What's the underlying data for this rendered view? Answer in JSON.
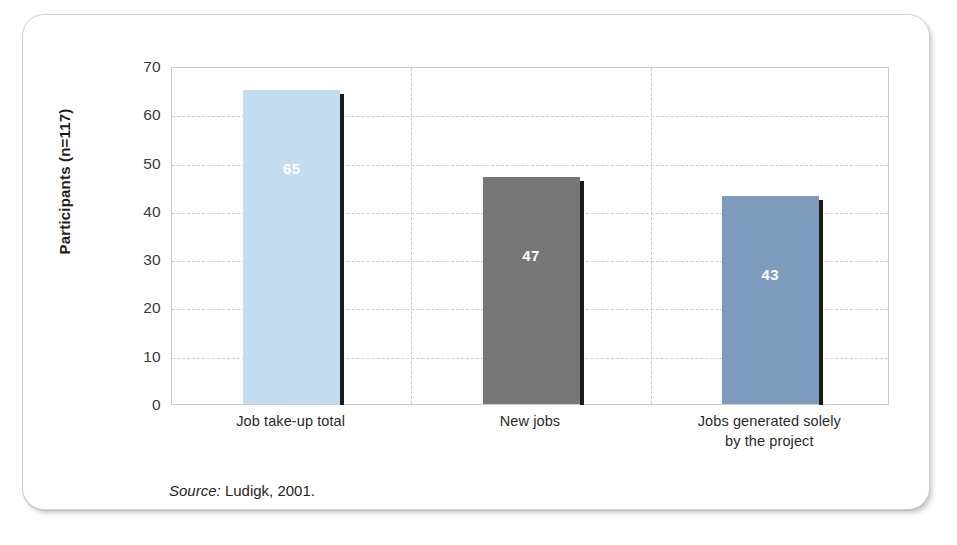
{
  "figure": {
    "source_label": "Source:",
    "source_text": "Ludigk, 2001."
  },
  "chart_data": {
    "type": "bar",
    "title": "",
    "xlabel": "",
    "ylabel": "Participants (n=117)",
    "ylim": [
      0,
      70
    ],
    "yticks": [
      0,
      10,
      20,
      30,
      40,
      50,
      60,
      70
    ],
    "ytick_labels": [
      "0",
      "10",
      "20",
      "30",
      "40",
      "50",
      "60",
      "70"
    ],
    "grid": true,
    "legend": "none",
    "categories": [
      "Job take-up total",
      "New jobs",
      "Jobs generated solely\nby the project"
    ],
    "category_lines": [
      [
        "Job take-up total"
      ],
      [
        "New jobs"
      ],
      [
        "Jobs generated solely",
        "by the project"
      ]
    ],
    "values": [
      65,
      47,
      43
    ],
    "data_labels": [
      "65",
      "47",
      "43"
    ],
    "bar_colors": [
      "#c3dcef",
      "#767676",
      "#7e9bbd"
    ],
    "bar_shadow_color": "#1a1a1a",
    "data_label_color": "#ffffff",
    "gridline_color": "#c9ccd0",
    "axis_color": "#c9cccf"
  }
}
